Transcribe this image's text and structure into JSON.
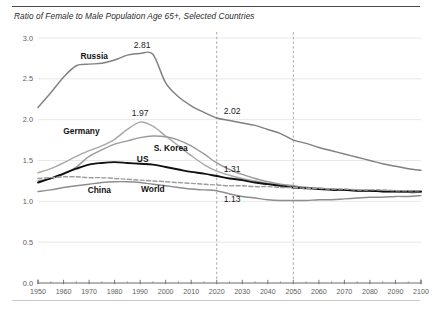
{
  "chart_data": {
    "type": "line",
    "title": "Ratio of Female to Male Population Age 65+, Selected Countries",
    "xlabel": "",
    "ylabel": "",
    "xlim": [
      1950,
      2100
    ],
    "ylim": [
      0.0,
      3.0
    ],
    "grid": true,
    "legend_position": "inline-labels",
    "y_ticks": [
      "0.0",
      "0.5",
      "1.0",
      "1.5",
      "2.0",
      "2.5",
      "3.0"
    ],
    "y_tick_values": [
      0.0,
      0.5,
      1.0,
      1.5,
      2.0,
      2.5,
      3.0
    ],
    "x_ticks": [
      "1950",
      "1960",
      "1970",
      "1980",
      "1990",
      "2000",
      "2010",
      "2020",
      "2030",
      "2040",
      "2050",
      "2060",
      "2070",
      "2080",
      "2090",
      "2100"
    ],
    "x_tick_values": [
      1950,
      1960,
      1970,
      1980,
      1990,
      2000,
      2010,
      2020,
      2030,
      2040,
      2050,
      2060,
      2070,
      2080,
      2090,
      2100
    ],
    "x": [
      1950,
      1955,
      1960,
      1965,
      1970,
      1975,
      1980,
      1985,
      1990,
      1995,
      2000,
      2005,
      2010,
      2015,
      2020,
      2025,
      2030,
      2035,
      2040,
      2045,
      2050,
      2055,
      2060,
      2065,
      2070,
      2075,
      2080,
      2085,
      2090,
      2095,
      2100
    ],
    "vertical_markers": [
      2020,
      2050
    ],
    "series": [
      {
        "name": "Russia",
        "color": "#808080",
        "style": "solid",
        "values": [
          2.15,
          2.33,
          2.52,
          2.66,
          2.68,
          2.69,
          2.73,
          2.79,
          2.81,
          2.8,
          2.45,
          2.28,
          2.17,
          2.09,
          2.02,
          1.99,
          1.96,
          1.93,
          1.88,
          1.83,
          1.75,
          1.71,
          1.66,
          1.62,
          1.58,
          1.54,
          1.5,
          1.46,
          1.43,
          1.4,
          1.38
        ]
      },
      {
        "name": "Germany",
        "color": "#a8a8a8",
        "style": "solid",
        "values": [
          1.35,
          1.4,
          1.47,
          1.55,
          1.62,
          1.68,
          1.76,
          1.88,
          1.97,
          1.92,
          1.8,
          1.68,
          1.56,
          1.45,
          1.37,
          1.32,
          1.28,
          1.25,
          1.22,
          1.2,
          1.18,
          1.17,
          1.16,
          1.15,
          1.14,
          1.13,
          1.13,
          1.12,
          1.12,
          1.11,
          1.11
        ]
      },
      {
        "name": "S. Korea",
        "color": "#9a9a9a",
        "style": "solid",
        "values": [
          1.25,
          1.28,
          1.33,
          1.42,
          1.55,
          1.63,
          1.7,
          1.74,
          1.78,
          1.8,
          1.79,
          1.75,
          1.68,
          1.58,
          1.47,
          1.39,
          1.33,
          1.28,
          1.24,
          1.21,
          1.19,
          1.17,
          1.16,
          1.15,
          1.14,
          1.13,
          1.13,
          1.12,
          1.12,
          1.11,
          1.11
        ]
      },
      {
        "name": "US",
        "color": "#111111",
        "style": "solid",
        "values": [
          1.23,
          1.28,
          1.34,
          1.4,
          1.45,
          1.47,
          1.48,
          1.47,
          1.46,
          1.45,
          1.42,
          1.39,
          1.36,
          1.34,
          1.31,
          1.28,
          1.26,
          1.23,
          1.21,
          1.19,
          1.17,
          1.16,
          1.15,
          1.14,
          1.14,
          1.13,
          1.13,
          1.12,
          1.12,
          1.12,
          1.12
        ]
      },
      {
        "name": "World",
        "color": "#9d9d9d",
        "style": "dashed",
        "values": [
          1.28,
          1.29,
          1.3,
          1.3,
          1.29,
          1.29,
          1.28,
          1.27,
          1.26,
          1.25,
          1.24,
          1.23,
          1.22,
          1.21,
          1.2,
          1.19,
          1.19,
          1.18,
          1.18,
          1.17,
          1.17,
          1.16,
          1.16,
          1.15,
          1.15,
          1.14,
          1.14,
          1.14,
          1.13,
          1.13,
          1.13
        ]
      },
      {
        "name": "China",
        "color": "#8d8d8d",
        "style": "solid",
        "values": [
          1.12,
          1.14,
          1.17,
          1.19,
          1.21,
          1.23,
          1.24,
          1.24,
          1.23,
          1.21,
          1.19,
          1.17,
          1.15,
          1.14,
          1.13,
          1.09,
          1.06,
          1.04,
          1.02,
          1.01,
          1.01,
          1.01,
          1.02,
          1.02,
          1.03,
          1.04,
          1.05,
          1.05,
          1.06,
          1.06,
          1.07
        ]
      }
    ],
    "annotations": [
      {
        "text": "2.81",
        "series": "Russia",
        "x": 1990,
        "y": 2.81
      },
      {
        "text": "1.97",
        "series": "Germany",
        "x": 1990,
        "y": 1.97
      },
      {
        "text": "2.02",
        "series": "Russia",
        "x": 2020,
        "y": 2.02
      },
      {
        "text": "1.31",
        "series": "US",
        "x": 2020,
        "y": 1.31
      },
      {
        "text": "1.13",
        "series": "China",
        "x": 2020,
        "y": 1.13
      }
    ],
    "series_labels": [
      {
        "text": "Russia",
        "x": 1972,
        "y": 2.74
      },
      {
        "text": "Germany",
        "x": 1967,
        "y": 1.83
      },
      {
        "text": "S. Korea",
        "x": 2002,
        "y": 1.62
      },
      {
        "text": "US",
        "x": 1991,
        "y": 1.48
      },
      {
        "text": "China",
        "x": 1974,
        "y": 1.1
      },
      {
        "text": "World",
        "x": 1995,
        "y": 1.11
      }
    ]
  }
}
